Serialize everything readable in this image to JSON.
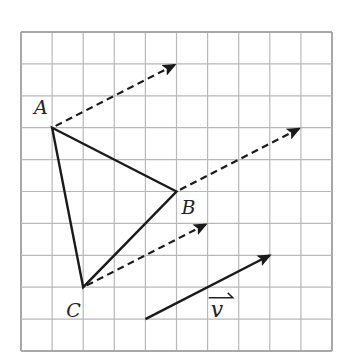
{
  "diagram": {
    "type": "geometry-translation",
    "grid": {
      "columns": 10,
      "rows": 10,
      "origin_px": [
        21,
        32
      ],
      "cell_px": [
        31.1,
        31.9
      ],
      "line_color": "#b8b8b8",
      "border_color": "#a8a8a8"
    },
    "triangle": {
      "stroke_color": "#1a1a1a",
      "vertices": [
        {
          "name": "A",
          "label": "A",
          "grid": [
            1,
            3
          ],
          "label_offset_px": [
            -18,
            -14
          ]
        },
        {
          "name": "B",
          "label": "B",
          "grid": [
            5,
            5
          ],
          "label_offset_px": [
            5,
            22
          ]
        },
        {
          "name": "C",
          "label": "C",
          "grid": [
            2,
            8
          ],
          "label_offset_px": [
            -17,
            30
          ]
        }
      ]
    },
    "translation_vector": {
      "label": "v",
      "components_grid": [
        4,
        -2
      ],
      "start_grid": [
        4,
        9
      ],
      "end_grid": [
        8,
        7
      ],
      "label_grid": [
        6.1,
        8.3
      ],
      "color": "#1a1a1a"
    },
    "translation_arrows": [
      {
        "from": "A",
        "from_grid": [
          1,
          3
        ],
        "to_grid": [
          5,
          1
        ],
        "style": "dashed"
      },
      {
        "from": "B",
        "from_grid": [
          5,
          5
        ],
        "to_grid": [
          9,
          3
        ],
        "style": "dashed"
      },
      {
        "from": "C",
        "from_grid": [
          2,
          8
        ],
        "to_grid": [
          6,
          6
        ],
        "style": "dashed"
      }
    ]
  }
}
